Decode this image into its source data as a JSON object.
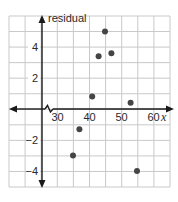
{
  "chart_data": {
    "type": "scatter",
    "title": "",
    "xlabel": "x",
    "ylabel": "residual",
    "x_ticks": [
      30,
      40,
      50,
      60
    ],
    "y_ticks": [
      -4,
      -2,
      2,
      4
    ],
    "x_tick_labels": [
      "30",
      "40",
      "50",
      "60"
    ],
    "y_tick_labels": [
      "-4",
      "-2",
      "2",
      "4"
    ],
    "xlim": [
      20,
      65
    ],
    "ylim": [
      -5,
      6
    ],
    "x_axis_break": true,
    "grid": true,
    "legend": null,
    "series": [
      {
        "name": "residuals",
        "points": [
          {
            "x": 35,
            "y": -3
          },
          {
            "x": 37,
            "y": -1.3
          },
          {
            "x": 41,
            "y": 0.8
          },
          {
            "x": 43,
            "y": 3.4
          },
          {
            "x": 45,
            "y": 5
          },
          {
            "x": 47,
            "y": 3.6
          },
          {
            "x": 53,
            "y": 0.4
          },
          {
            "x": 55,
            "y": -4
          }
        ]
      }
    ]
  },
  "colors": {
    "grid": "#c9c9c9",
    "axis": "#1a1a1a",
    "point": "#454545",
    "text": "#2a2a2a"
  }
}
